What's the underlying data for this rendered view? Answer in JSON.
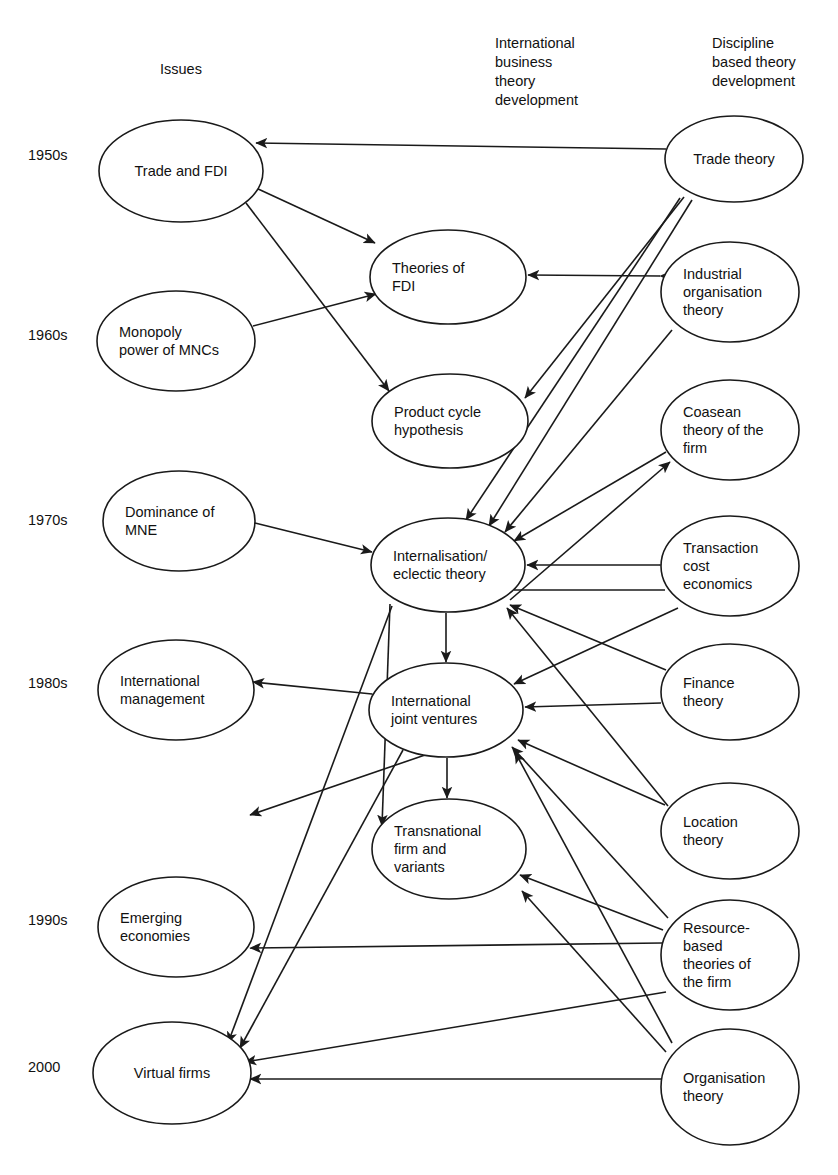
{
  "figure": {
    "background": "#ffffff",
    "line_color": "#1a1a1a"
  },
  "column_headings": [
    {
      "id": "issues",
      "label": "Issues",
      "lines": [
        "Issues"
      ],
      "x": 181,
      "y": 74
    },
    {
      "id": "ib-theory",
      "label": "International business theory development",
      "lines": [
        "International",
        "business",
        "theory",
        "development"
      ],
      "x": 495,
      "y": 48
    },
    {
      "id": "discipline-theory",
      "label": "Discipline based theory development",
      "lines": [
        "Discipline",
        "based theory",
        "development"
      ],
      "x": 712,
      "y": 48
    }
  ],
  "era_labels": [
    {
      "id": "1950s",
      "label": "1950s",
      "x": 28,
      "y": 160
    },
    {
      "id": "1960s",
      "label": "1960s",
      "x": 28,
      "y": 340
    },
    {
      "id": "1970s",
      "label": "1970s",
      "x": 28,
      "y": 525
    },
    {
      "id": "1980s",
      "label": "1980s",
      "x": 28,
      "y": 688
    },
    {
      "id": "1990s",
      "label": "1990s",
      "x": 28,
      "y": 925
    },
    {
      "id": "2000",
      "label": "2000",
      "x": 28,
      "y": 1072
    }
  ],
  "nodes": [
    {
      "id": "trade-and-fdi",
      "label": "Trade and FDI",
      "lines": [
        "Trade and FDI"
      ],
      "column": "issues",
      "era": "1950s",
      "cx": 181,
      "cy": 171,
      "rx": 82,
      "ry": 51
    },
    {
      "id": "monopoly-power-of-mncs",
      "label": "Monopoly power of MNCs",
      "lines": [
        "Monopoly",
        "power of MNCs"
      ],
      "column": "issues",
      "era": "1960s",
      "cx": 176,
      "cy": 341,
      "rx": 79,
      "ry": 50
    },
    {
      "id": "dominance-of-mne",
      "label": "Dominance of MNE",
      "lines": [
        "Dominance of",
        "MNE"
      ],
      "column": "issues",
      "era": "1970s",
      "cx": 179,
      "cy": 521,
      "rx": 76,
      "ry": 50
    },
    {
      "id": "international-management",
      "label": "International management",
      "lines": [
        "International",
        "management"
      ],
      "column": "issues",
      "era": "1980s",
      "cx": 176,
      "cy": 690,
      "rx": 78,
      "ry": 50
    },
    {
      "id": "emerging-economies",
      "label": "Emerging economies",
      "lines": [
        "Emerging",
        "economies"
      ],
      "column": "issues",
      "era": "1990s",
      "cx": 176,
      "cy": 927,
      "rx": 78,
      "ry": 50
    },
    {
      "id": "virtual-firms",
      "label": "Virtual firms",
      "lines": [
        "Virtual firms"
      ],
      "column": "issues",
      "era": "2000",
      "cx": 172,
      "cy": 1073,
      "rx": 79,
      "ry": 51
    },
    {
      "id": "theories-of-fdi",
      "label": "Theories of FDI",
      "lines": [
        "Theories of",
        "FDI"
      ],
      "column": "ib-theory",
      "era": "1950s-60s",
      "cx": 448,
      "cy": 277,
      "rx": 78,
      "ry": 47
    },
    {
      "id": "product-cycle-hypothesis",
      "label": "Product cycle hypothesis",
      "lines": [
        "Product cycle",
        "hypothesis"
      ],
      "column": "ib-theory",
      "era": "1960s",
      "cx": 450,
      "cy": 421,
      "rx": 78,
      "ry": 47
    },
    {
      "id": "internalisation-eclectic-theory",
      "label": "Internalisation/ eclectic theory",
      "lines": [
        "Internalisation/",
        "eclectic theory"
      ],
      "column": "ib-theory",
      "era": "1970s",
      "cx": 448,
      "cy": 565,
      "rx": 77,
      "ry": 47
    },
    {
      "id": "international-joint-ventures",
      "label": "International joint ventures",
      "lines": [
        "International",
        "joint ventures"
      ],
      "column": "ib-theory",
      "era": "1980s",
      "cx": 446,
      "cy": 710,
      "rx": 77,
      "ry": 47
    },
    {
      "id": "transnational-firm-and-variants",
      "label": "Transnational firm and variants",
      "lines": [
        "Transnational",
        "firm and",
        "variants"
      ],
      "column": "ib-theory",
      "era": "1980s-90s",
      "cx": 449,
      "cy": 849,
      "rx": 77,
      "ry": 50
    },
    {
      "id": "trade-theory",
      "label": "Trade theory",
      "lines": [
        "Trade theory"
      ],
      "column": "discipline-theory",
      "era": "1950s",
      "cx": 734,
      "cy": 159,
      "rx": 69,
      "ry": 43
    },
    {
      "id": "industrial-organisation-theory",
      "label": "Industrial organisation theory",
      "lines": [
        "Industrial",
        "organisation",
        "theory"
      ],
      "column": "discipline-theory",
      "era": "1960s",
      "cx": 730,
      "cy": 292,
      "rx": 69,
      "ry": 50
    },
    {
      "id": "coasean-theory-of-the-firm",
      "label": "Coasean theory of the firm",
      "lines": [
        "Coasean",
        "theory of the",
        "firm"
      ],
      "column": "discipline-theory",
      "era": "1970s",
      "cx": 730,
      "cy": 430,
      "rx": 69,
      "ry": 50
    },
    {
      "id": "transaction-cost-economics",
      "label": "Transaction cost economics",
      "lines": [
        "Transaction",
        "cost",
        "economics"
      ],
      "column": "discipline-theory",
      "era": "1970s",
      "cx": 730,
      "cy": 566,
      "rx": 69,
      "ry": 50
    },
    {
      "id": "finance-theory",
      "label": "Finance theory",
      "lines": [
        "Finance",
        "theory"
      ],
      "column": "discipline-theory",
      "era": "1980s",
      "cx": 730,
      "cy": 692,
      "rx": 69,
      "ry": 48
    },
    {
      "id": "location-theory",
      "label": "Location theory",
      "lines": [
        "Location",
        "theory"
      ],
      "column": "discipline-theory",
      "era": "1980s-90s",
      "cx": 730,
      "cy": 831,
      "rx": 69,
      "ry": 48
    },
    {
      "id": "resource-based-theories-of-the-firm",
      "label": "Resource- based theories of the firm",
      "lines": [
        "Resource-",
        "based",
        "theories of",
        "the firm"
      ],
      "column": "discipline-theory",
      "era": "1990s",
      "cx": 730,
      "cy": 955,
      "rx": 69,
      "ry": 55
    },
    {
      "id": "organisation-theory",
      "label": "Organisation theory",
      "lines": [
        "Organisation",
        "theory"
      ],
      "column": "discipline-theory",
      "era": "2000",
      "cx": 730,
      "cy": 1087,
      "rx": 69,
      "ry": 58
    }
  ],
  "edges": [
    {
      "id": "trade-theory-to-trade-and-fdi",
      "from": "trade-theory",
      "to": "trade-and-fdi",
      "arrows": "to",
      "x1": 666,
      "y1": 149,
      "x2": 256,
      "y2": 143
    },
    {
      "id": "trade-and-fdi-to-theories-of-fdi",
      "from": "trade-and-fdi",
      "to": "theories-of-fdi",
      "arrows": "to",
      "x1": 256,
      "y1": 188,
      "x2": 375,
      "y2": 243
    },
    {
      "id": "trade-and-fdi-to-product-cycle",
      "from": "trade-and-fdi",
      "to": "product-cycle-hypothesis",
      "arrows": "to",
      "x1": 246,
      "y1": 203,
      "x2": 389,
      "y2": 391
    },
    {
      "id": "monopoly-power-to-theories-of-fdi",
      "from": "monopoly-power-of-mncs",
      "to": "theories-of-fdi",
      "arrows": "to",
      "x1": 253,
      "y1": 326,
      "x2": 376,
      "y2": 294
    },
    {
      "id": "industrial-organisation-to-theories-of-fdi",
      "from": "industrial-organisation-theory",
      "to": "theories-of-fdi",
      "arrows": "both",
      "x1": 660,
      "y1": 276,
      "x2": 528,
      "y2": 275
    },
    {
      "id": "trade-theory-to-product-cycle",
      "from": "trade-theory",
      "to": "product-cycle-hypothesis",
      "arrows": "to",
      "x1": 684,
      "y1": 197,
      "x2": 525,
      "y2": 398
    },
    {
      "id": "trade-theory-to-internalisation-a",
      "from": "trade-theory",
      "to": "internalisation-eclectic-theory",
      "arrows": "to",
      "x1": 680,
      "y1": 198,
      "x2": 466,
      "y2": 520
    },
    {
      "id": "trade-theory-to-internalisation-b",
      "from": "trade-theory",
      "to": "internalisation-eclectic-theory",
      "arrows": "to",
      "x1": 692,
      "y1": 200,
      "x2": 489,
      "y2": 526
    },
    {
      "id": "industrial-organisation-to-internalisation",
      "from": "industrial-organisation-theory",
      "to": "internalisation-eclectic-theory",
      "arrows": "to",
      "x1": 672,
      "y1": 330,
      "x2": 505,
      "y2": 532
    },
    {
      "id": "coasean-to-internalisation",
      "from": "coasean-theory-of-the-firm",
      "to": "internalisation-eclectic-theory",
      "arrows": "to",
      "x1": 666,
      "y1": 452,
      "x2": 514,
      "y2": 541
    },
    {
      "id": "transaction-cost-to-internalisation",
      "from": "transaction-cost-economics",
      "to": "internalisation-eclectic-theory",
      "arrows": "both",
      "x1": 660,
      "y1": 565,
      "x2": 527,
      "y2": 565
    },
    {
      "id": "internalisation-to-coasean",
      "from": "internalisation-eclectic-theory",
      "to": "coasean-theory-of-the-firm",
      "arrows": "to",
      "x1": 510,
      "y1": 600,
      "x2": 670,
      "y2": 462
    },
    {
      "id": "internalisation-to-transaction-cost",
      "from": "internalisation-eclectic-theory",
      "to": "transaction-cost-economics",
      "arrows": "none",
      "x1": 514,
      "y1": 590,
      "x2": 665,
      "y2": 590
    },
    {
      "id": "dominance-of-mne-to-internalisation",
      "from": "dominance-of-mne",
      "to": "internalisation-eclectic-theory",
      "arrows": "both",
      "x1": 255,
      "y1": 523,
      "x2": 372,
      "y2": 552
    },
    {
      "id": "internalisation-to-ijv",
      "from": "internalisation-eclectic-theory",
      "to": "international-joint-ventures",
      "arrows": "to",
      "x1": 446,
      "y1": 613,
      "x2": 446,
      "y2": 662
    },
    {
      "id": "finance-theory-to-internalisation",
      "from": "finance-theory",
      "to": "internalisation-eclectic-theory",
      "arrows": "to",
      "x1": 666,
      "y1": 670,
      "x2": 510,
      "y2": 605
    },
    {
      "id": "location-theory-to-internalisation",
      "from": "location-theory",
      "to": "internalisation-eclectic-theory",
      "arrows": "to",
      "x1": 668,
      "y1": 806,
      "x2": 507,
      "y2": 608
    },
    {
      "id": "finance-theory-to-ijv",
      "from": "finance-theory",
      "to": "international-joint-ventures",
      "arrows": "to",
      "x1": 661,
      "y1": 703,
      "x2": 525,
      "y2": 707
    },
    {
      "id": "location-theory-to-ijv",
      "from": "location-theory",
      "to": "international-joint-ventures",
      "arrows": "to",
      "x1": 665,
      "y1": 805,
      "x2": 518,
      "y2": 740
    },
    {
      "id": "transaction-cost-to-ijv",
      "from": "transaction-cost-economics",
      "to": "international-joint-ventures",
      "arrows": "to",
      "x1": 678,
      "y1": 608,
      "x2": 514,
      "y2": 684
    },
    {
      "id": "ijv-to-international-management",
      "from": "international-joint-ventures",
      "to": "international-management",
      "arrows": "both",
      "x1": 372,
      "y1": 694,
      "x2": 253,
      "y2": 682
    },
    {
      "id": "ijv-to-transnational-firm",
      "from": "international-joint-ventures",
      "to": "transnational-firm-and-variants",
      "arrows": "to",
      "x1": 447,
      "y1": 758,
      "x2": 447,
      "y2": 798
    },
    {
      "id": "ijv-to-international-management-lower",
      "from": "international-joint-ventures",
      "to": "international-management",
      "arrows": "to",
      "x1": 425,
      "y1": 755,
      "x2": 250,
      "y2": 815
    },
    {
      "id": "internalisation-to-transnational-firm",
      "from": "internalisation-eclectic-theory",
      "to": "transnational-firm-and-variants",
      "arrows": "to",
      "x1": 390,
      "y1": 604,
      "x2": 382,
      "y2": 826
    },
    {
      "id": "internalisation-to-virtual-firms",
      "from": "internalisation-eclectic-theory",
      "to": "virtual-firms",
      "arrows": "to",
      "x1": 392,
      "y1": 606,
      "x2": 228,
      "y2": 1043
    },
    {
      "id": "ijv-to-virtual-firms",
      "from": "international-joint-ventures",
      "to": "virtual-firms",
      "arrows": "to",
      "x1": 403,
      "y1": 750,
      "x2": 240,
      "y2": 1048
    },
    {
      "id": "resource-based-to-transnational-firm",
      "from": "resource-based-theories-of-the-firm",
      "to": "transnational-firm-and-variants",
      "arrows": "to",
      "x1": 663,
      "y1": 930,
      "x2": 520,
      "y2": 875
    },
    {
      "id": "resource-based-to-ijv",
      "from": "resource-based-theories-of-the-firm",
      "to": "international-joint-ventures",
      "arrows": "to",
      "x1": 668,
      "y1": 918,
      "x2": 512,
      "y2": 747
    },
    {
      "id": "resource-based-to-emerging-economies",
      "from": "resource-based-theories-of-the-firm",
      "to": "emerging-economies",
      "arrows": "to",
      "x1": 662,
      "y1": 943,
      "x2": 250,
      "y2": 948
    },
    {
      "id": "resource-based-to-virtual-firms",
      "from": "resource-based-theories-of-the-firm",
      "to": "virtual-firms",
      "arrows": "to",
      "x1": 666,
      "y1": 992,
      "x2": 245,
      "y2": 1062
    },
    {
      "id": "organisation-theory-to-transnational-firm",
      "from": "organisation-theory",
      "to": "transnational-firm-and-variants",
      "arrows": "to",
      "x1": 666,
      "y1": 1052,
      "x2": 522,
      "y2": 891
    },
    {
      "id": "organisation-theory-to-ijv",
      "from": "organisation-theory",
      "to": "international-joint-ventures",
      "arrows": "to",
      "x1": 672,
      "y1": 1043,
      "x2": 515,
      "y2": 752
    },
    {
      "id": "organisation-theory-to-virtual-firms",
      "from": "organisation-theory",
      "to": "virtual-firms",
      "arrows": "to",
      "x1": 661,
      "y1": 1079,
      "x2": 250,
      "y2": 1079
    }
  ]
}
